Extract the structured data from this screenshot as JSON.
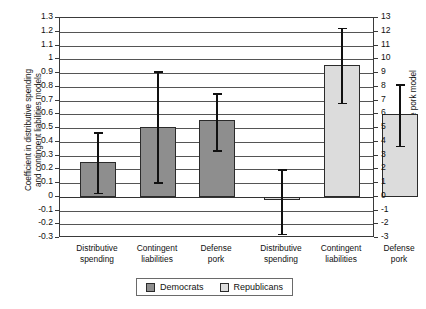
{
  "chart_data": {
    "type": "bar",
    "title": "",
    "categories": [
      "Distributive spending",
      "Contingent liabilities",
      "Defense pork"
    ],
    "series": [
      {
        "name": "Democrats",
        "axis": "left",
        "values": [
          0.25,
          0.51,
          0.555
        ],
        "err_low": [
          0.03,
          0.105,
          0.34
        ],
        "err_high": [
          0.47,
          0.915,
          0.755
        ]
      },
      {
        "name": "Republicans",
        "axis": "right",
        "values": [
          -0.2,
          9.6,
          6.0
        ],
        "err_low": [
          -2.7,
          6.85,
          3.7
        ],
        "err_high": [
          2.0,
          12.3,
          8.2
        ]
      }
    ],
    "ylabel_left": "Coefficient in distributive spending and contingent liabilities models",
    "ylabel_right": "Coefficient in defense pork model",
    "ylim_left": [
      -0.3,
      1.3
    ],
    "ylim_right": [
      -3,
      13
    ],
    "yticks_left": [
      "1.3",
      "1.2",
      "1.1",
      "1",
      "0.9",
      "0.8",
      "0.7",
      "0.6",
      "0.5",
      "0.4",
      "0.3",
      "0.2",
      "0.1",
      "0",
      "-0.1",
      "-0.2",
      "-0.3"
    ],
    "yticks_right": [
      "13",
      "12",
      "11",
      "10",
      "9",
      "8",
      "7",
      "6",
      "5",
      "4",
      "3",
      "2",
      "1",
      "0",
      "-1",
      "-2",
      "-3"
    ],
    "grid": true,
    "legend_position": "bottom"
  },
  "axes": {
    "left_title_line1": "Coefficient in distributive spending",
    "left_title_line2": "and contingent liabilities models",
    "right_title": "Coefficient in defense pork model"
  },
  "categories": {
    "dem": [
      {
        "line1": "Distributive",
        "line2": "spending"
      },
      {
        "line1": "Contingent",
        "line2": "liabilities"
      },
      {
        "line1": "Defense",
        "line2": "pork"
      }
    ],
    "rep": [
      {
        "line1": "Distributive",
        "line2": "spending"
      },
      {
        "line1": "Contingent",
        "line2": "liabilities"
      },
      {
        "line1": "Defense",
        "line2": "pork"
      }
    ]
  },
  "legend": {
    "items": [
      {
        "label": "Democrats",
        "color": "#8e8e8e"
      },
      {
        "label": "Republicans",
        "color": "#dcdcdc"
      }
    ]
  }
}
